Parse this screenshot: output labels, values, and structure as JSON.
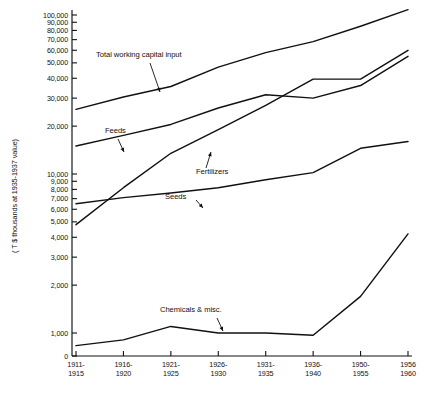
{
  "chart_data": {
    "type": "line",
    "title": "",
    "xlabel": "",
    "ylabel": "( T $ thousands at 1935-1937 value)",
    "yscale": "log",
    "ylim": [
      0,
      100000
    ],
    "grid": false,
    "legend_position": "inline-annotations",
    "categories": [
      "1911-\n1915",
      "1916-\n1920",
      "1921-\n1925",
      "1926-\n1930",
      "1931-\n1935",
      "1936-\n1940",
      "1950-\n1955",
      "1956-\n1960"
    ],
    "x_tick_labels": [
      {
        "line1": "1911-",
        "line2": "1915"
      },
      {
        "line1": "1916-",
        "line2": "1920"
      },
      {
        "line1": "1921-",
        "line2": "1925"
      },
      {
        "line1": "1926-",
        "line2": "1930"
      },
      {
        "line1": "1931-",
        "line2": "1935"
      },
      {
        "line1": "1936-",
        "line2": "1940"
      },
      {
        "line1": "1950-",
        "line2": "1955"
      },
      {
        "line1": "1956",
        "line2": "1960"
      }
    ],
    "y_tick_labels": [
      "100,000",
      "90,000",
      "80,000",
      "70,000",
      "60,000",
      "50,000",
      "40,000",
      "30,000",
      "20,000",
      "10,000",
      "9,000",
      "8,000",
      "7,000",
      "6,000",
      "5,000",
      "4,000",
      "3,000",
      "2,000",
      "1,000",
      "0"
    ],
    "y_tick_values": [
      100000,
      90000,
      80000,
      70000,
      60000,
      50000,
      40000,
      30000,
      20000,
      10000,
      9000,
      8000,
      7000,
      6000,
      5000,
      4000,
      3000,
      2000,
      1000,
      0
    ],
    "series": [
      {
        "name": "Total working capital input",
        "values": [
          25500,
          30500,
          35500,
          47000,
          58000,
          68000,
          85000,
          108000
        ]
      },
      {
        "name": "Feeds",
        "values": [
          15000,
          17500,
          20500,
          26000,
          31500,
          30000,
          36000,
          55000
        ]
      },
      {
        "name": "Fertilizers",
        "values": [
          4800,
          8200,
          13500,
          19000,
          27000,
          39500,
          39500,
          60000
        ]
      },
      {
        "name": "Seeds",
        "values": [
          6500,
          7100,
          7600,
          8200,
          9200,
          10200,
          14500,
          16000
        ]
      },
      {
        "name": "Chemicals & misc.",
        "values": [
          450,
          700,
          1100,
          1000,
          1000,
          900,
          1700,
          4200
        ]
      }
    ],
    "annotations": [
      {
        "text": "Total working capital input",
        "x_px": 96,
        "y_px": 57
      },
      {
        "text": "Feeds",
        "x_px": 105,
        "y_px": 133
      },
      {
        "text": "Fertilizers",
        "x_px": 196,
        "y_px": 174
      },
      {
        "text": "Seeds",
        "x_px": 165,
        "y_px": 199
      },
      {
        "text": "Chemicals & misc.",
        "x_px": 160,
        "y_px": 312
      }
    ]
  },
  "axis": {
    "y_title": "( T $ thousands at 1935-1937 value)"
  },
  "colors": {
    "ink": "#111111",
    "background": "#ffffff"
  }
}
